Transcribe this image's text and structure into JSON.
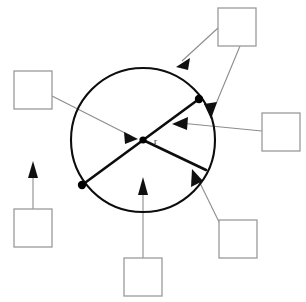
{
  "page": {
    "width": 306,
    "height": 302,
    "background_color": "#ffffff"
  },
  "figure": {
    "name": "circle-diagram",
    "circle": {
      "center_x": 143,
      "center_y": 140,
      "radius": 72,
      "stroke_color": "#0d0d0d",
      "stroke_width": 2.1
    },
    "center_label": "r",
    "center_label_x": 155,
    "center_label_y": 144,
    "points": [
      {
        "name": "center-point",
        "x": 143,
        "y": 140,
        "r": 3.6
      },
      {
        "name": "upper-right-point",
        "x": 199,
        "y": 99,
        "r": 4.2
      },
      {
        "name": "lower-left-point",
        "x": 82,
        "y": 185,
        "r": 4.2
      }
    ],
    "segments": [
      {
        "name": "diameter-segment",
        "x1": 82,
        "y1": 185,
        "x2": 199,
        "y2": 99
      },
      {
        "name": "chord-segment",
        "x1": 143,
        "y1": 140,
        "x2": 206,
        "y2": 170
      }
    ]
  },
  "answer_boxes": [
    {
      "name": "answer-box-circumference",
      "value": "",
      "x": 218,
      "y": 8,
      "w": 38,
      "h": 38
    },
    {
      "name": "answer-box-radius",
      "value": "",
      "x": 14,
      "y": 71,
      "w": 38,
      "h": 38
    },
    {
      "name": "answer-box-diameter",
      "value": "",
      "x": 262,
      "y": 113,
      "w": 38,
      "h": 38
    },
    {
      "name": "answer-box-sector",
      "value": "",
      "x": 14,
      "y": 209,
      "w": 38,
      "h": 38
    },
    {
      "name": "answer-box-arc",
      "value": "",
      "x": 219,
      "y": 220,
      "w": 38,
      "h": 38
    },
    {
      "name": "answer-box-chord",
      "value": "",
      "x": 124,
      "y": 258,
      "w": 38,
      "h": 38
    }
  ],
  "leaders": [
    {
      "name": "leader-circumference",
      "from_box": "answer-box-circumference",
      "path": "M 218 28 L 180 62",
      "head_points": "180,62 192,62 186,73",
      "head_angle": -42
    },
    {
      "name": "leader-point-on-circle",
      "from_box": "answer-box-circumference",
      "path": "M 238 46 L 212 112",
      "head_points": "212,112 204,104 217,101",
      "head_angle": 68
    },
    {
      "name": "leader-radius",
      "from_box": "answer-box-radius",
      "path": "M 52 96 L 132 136",
      "head_points": "132,136 120,133 123,144",
      "head_angle": 27
    },
    {
      "name": "leader-diameter",
      "from_box": "answer-box-diameter",
      "path": "M 262 130 L 176 123",
      "head_points": "176,123 188,118 187,130",
      "head_angle": 185
    },
    {
      "name": "leader-sector",
      "from_box": "answer-box-sector",
      "path": "M 33 209 L 33 168",
      "head_points": "33,162 28,177 38,177",
      "head_angle": -90
    },
    {
      "name": "leader-arc",
      "from_box": "answer-box-arc",
      "path": "M 219 228 L 197 180",
      "head_points": "193,172 190,187 202,182",
      "head_angle": -115
    },
    {
      "name": "leader-chord",
      "from_box": "answer-box-chord",
      "path": "M 143 258 L 143 186",
      "head_points": "143,178 138,194 148,194",
      "head_angle": -90
    }
  ],
  "colors": {
    "ink": "#0d0d0d",
    "leader": "#8c8c8c",
    "box_border": "#9a9a9a",
    "paper": "#ffffff"
  }
}
